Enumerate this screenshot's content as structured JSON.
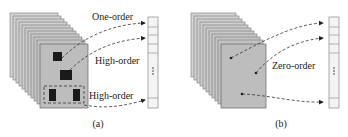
{
  "panels": [
    {
      "caption": "(a)",
      "labels": [
        "One-order",
        "High-order",
        "High-order"
      ],
      "vector_ellipsis": "⋮"
    },
    {
      "caption": "(b)",
      "labels": [
        "Zero-order"
      ],
      "vector_ellipsis": "⋮"
    }
  ],
  "colors": {
    "sheet_fill": "#c8c8c8",
    "sheet_stroke": "#777777",
    "front_fill": "#bdbdbd",
    "patch_fill": "#1a1a1a",
    "arrow": "#333333",
    "vector_fill": "#f4f4f4",
    "vector_stroke": "#888888"
  }
}
